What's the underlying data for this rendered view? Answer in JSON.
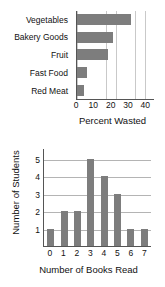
{
  "chart_data": [
    {
      "type": "bar",
      "orientation": "horizontal",
      "title": "",
      "categories": [
        "Vegetables",
        "Bakery Goods",
        "Fruit",
        "Fast Food",
        "Red Meat"
      ],
      "values": [
        31,
        21,
        18,
        6,
        4
      ],
      "xlabel": "Percent Wasted",
      "ylabel": "",
      "xlim": [
        0,
        45
      ],
      "xticks": [
        0,
        10,
        20,
        30,
        40
      ],
      "gridline_interval": 5,
      "grid": true,
      "legend": "none",
      "bar_color": "#7d7d7d"
    },
    {
      "type": "bar",
      "orientation": "vertical",
      "subtype": "histogram",
      "title": "",
      "categories": [
        "0",
        "1",
        "2",
        "3",
        "4",
        "5",
        "6",
        "7"
      ],
      "values": [
        1,
        2,
        2,
        5,
        4,
        3,
        1,
        1
      ],
      "xlabel": "Number of Books Read",
      "ylabel": "Number of Students",
      "ylim": [
        0,
        5.6
      ],
      "yticks": [
        1,
        2,
        3,
        4,
        5
      ],
      "xticks": [
        0,
        1,
        2,
        3,
        4,
        5,
        6,
        7
      ],
      "grid": true,
      "legend": "none",
      "bar_color": "#7d7d7d"
    }
  ],
  "bar_chart": {
    "categories": [
      "Vegetables",
      "Bakery Goods",
      "Fruit",
      "Fast Food",
      "Red Meat"
    ],
    "xticks": [
      "0",
      "10",
      "20",
      "30",
      "40"
    ],
    "xtitle": "Percent Wasted"
  },
  "histogram": {
    "ytitle": "Number of Students",
    "yticks": [
      "5",
      "4",
      "3",
      "2",
      "1"
    ],
    "xticks": [
      "0",
      "1",
      "2",
      "3",
      "4",
      "5",
      "6",
      "7"
    ],
    "xtitle": "Number of Books Read"
  }
}
